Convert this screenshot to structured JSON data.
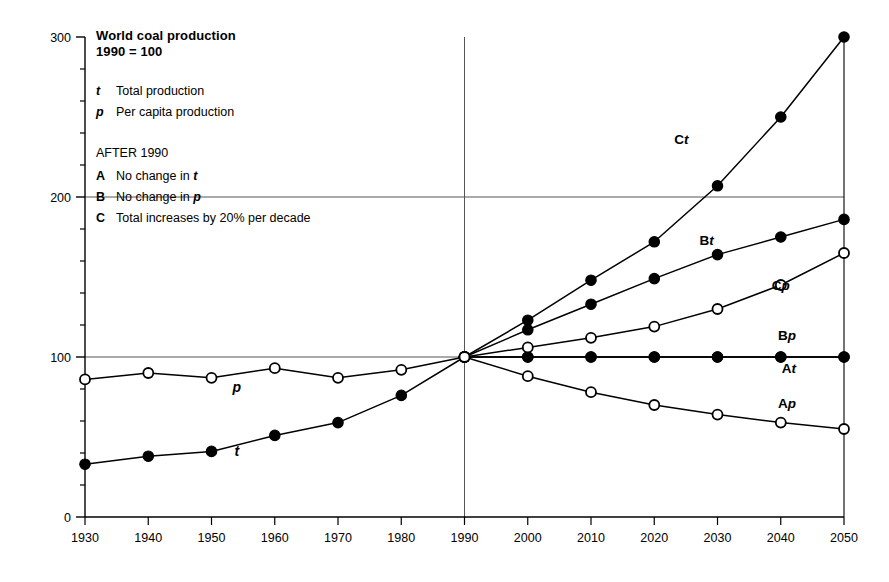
{
  "figure": {
    "title_line1": "World coal production",
    "title_line2": "1990 = 100",
    "after_label": "AFTER 1990"
  },
  "legend": {
    "series_keys": [
      {
        "key": "t",
        "label": "Total production"
      },
      {
        "key": "p",
        "label": "Per capita production"
      }
    ],
    "scenarios": [
      {
        "key": "A",
        "label_pre": "No change in ",
        "label_em": "t",
        "label_post": ""
      },
      {
        "key": "B",
        "label_pre": "No change in ",
        "label_em": "p",
        "label_post": ""
      },
      {
        "key": "C",
        "label_pre": "Total increases by 20% per decade",
        "label_em": "",
        "label_post": ""
      }
    ]
  },
  "inline_labels": {
    "historical_t": "t",
    "historical_p": "p"
  },
  "curve_labels": [
    {
      "id": "Ct",
      "prefix": "C",
      "suffix": "t"
    },
    {
      "id": "Bt",
      "prefix": "B",
      "suffix": "t"
    },
    {
      "id": "Cp",
      "prefix": "C",
      "suffix": "p"
    },
    {
      "id": "Bp",
      "prefix": "B",
      "suffix": "p"
    },
    {
      "id": "At",
      "prefix": "A",
      "suffix": "t"
    },
    {
      "id": "Ap",
      "prefix": "A",
      "suffix": "p"
    }
  ],
  "chart_data": {
    "type": "line",
    "xlabel": "",
    "ylabel": "",
    "xlim": [
      1930,
      2050
    ],
    "ylim": [
      0,
      300
    ],
    "yticks": [
      0,
      100,
      200,
      300
    ],
    "yticks_minor": [
      20,
      40,
      60,
      80,
      120,
      140,
      160,
      180,
      220,
      240,
      260,
      280
    ],
    "xticks": [
      1930,
      1940,
      1950,
      1960,
      1970,
      1980,
      1990,
      2000,
      2010,
      2020,
      2030,
      2040,
      2050
    ],
    "grid": true,
    "gridlines_horizontal": [
      100,
      200
    ],
    "gridlines_vertical": [
      1990
    ],
    "legend_position": "inline-right",
    "marker_legend": {
      "filled_circle": "total production (t)",
      "open_circle": "per capita production (p)"
    },
    "series": [
      {
        "name": "t",
        "label": "Total production (historical)",
        "marker": "filled-circle",
        "x": [
          1930,
          1940,
          1950,
          1960,
          1970,
          1980,
          1990
        ],
        "values": [
          33,
          38,
          41,
          51,
          59,
          76,
          100
        ]
      },
      {
        "name": "p",
        "label": "Per capita production (historical)",
        "marker": "open-circle",
        "x": [
          1930,
          1940,
          1950,
          1960,
          1970,
          1980,
          1990
        ],
        "values": [
          86,
          90,
          87,
          93,
          87,
          92,
          100
        ]
      },
      {
        "name": "At",
        "label": "Scenario A - total production",
        "marker": "filled-circle",
        "x": [
          1990,
          2000,
          2010,
          2020,
          2030,
          2040,
          2050
        ],
        "values": [
          100,
          100,
          100,
          100,
          100,
          100,
          100
        ]
      },
      {
        "name": "Ap",
        "label": "Scenario A - per capita production",
        "marker": "open-circle",
        "x": [
          1990,
          2000,
          2010,
          2020,
          2030,
          2040,
          2050
        ],
        "values": [
          100,
          88,
          78,
          70,
          64,
          59,
          55
        ]
      },
      {
        "name": "Bt",
        "label": "Scenario B - total production",
        "marker": "filled-circle",
        "x": [
          1990,
          2000,
          2010,
          2020,
          2030,
          2040,
          2050
        ],
        "values": [
          100,
          117,
          133,
          149,
          164,
          175,
          186
        ]
      },
      {
        "name": "Bp",
        "label": "Scenario B - per capita production",
        "marker": "filled-circle",
        "x": [
          1990,
          2000,
          2010,
          2020,
          2030,
          2040,
          2050
        ],
        "values": [
          100,
          100,
          100,
          100,
          100,
          100,
          100
        ]
      },
      {
        "name": "Ct",
        "label": "Scenario C - total production",
        "marker": "filled-circle",
        "x": [
          1990,
          2000,
          2010,
          2020,
          2030,
          2040,
          2050
        ],
        "values": [
          100,
          123,
          148,
          172,
          207,
          250,
          300
        ]
      },
      {
        "name": "Cp",
        "label": "Scenario C - per capita production",
        "marker": "open-circle",
        "x": [
          1990,
          2000,
          2010,
          2020,
          2030,
          2040,
          2050
        ],
        "values": [
          100,
          106,
          112,
          119,
          130,
          145,
          165
        ]
      }
    ]
  },
  "colors": {
    "ink": "#000000",
    "grid": "#555555",
    "background": "#ffffff"
  }
}
